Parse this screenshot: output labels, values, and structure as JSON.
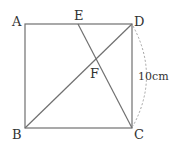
{
  "figure": {
    "type": "square-geometry",
    "points": {
      "A": {
        "label": "A"
      },
      "B": {
        "label": "B"
      },
      "C": {
        "label": "C"
      },
      "D": {
        "label": "D"
      },
      "E": {
        "label": "E"
      },
      "F": {
        "label": "F"
      }
    },
    "segments": [
      "AD",
      "DC",
      "CB",
      "BA",
      "BD",
      "EC"
    ],
    "measurement": {
      "side": "DC",
      "label": "10cm"
    },
    "colors": {
      "line": "#666666",
      "text": "#333333",
      "dashed": "#999999"
    }
  }
}
